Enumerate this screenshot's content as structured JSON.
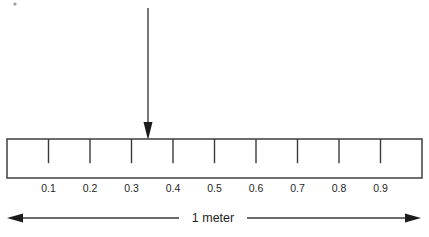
{
  "figure": {
    "background_color": "#ffffff",
    "line_color": "#3b3b3b",
    "outline_color": "#4a4a4a",
    "arrow_fill_color": "#1c1c1c",
    "text_color": "#1f1f1f"
  },
  "ruler": {
    "name": "meter-stick",
    "left_x": 7,
    "right_x": 422,
    "top_y": 139,
    "bottom_y": 178,
    "segments": 10,
    "tick_count": 9,
    "tick_depth_fraction": 0.62,
    "tick_labels": [
      "0.1",
      "0.2",
      "0.3",
      "0.4",
      "0.5",
      "0.6",
      "0.7",
      "0.8",
      "0.9"
    ],
    "tick_values": [
      0.1,
      0.2,
      0.3,
      0.4,
      0.5,
      0.6,
      0.7,
      0.8,
      0.9
    ],
    "label_baseline_y": 192
  },
  "pointer": {
    "name": "measurement-pointer",
    "value": 0.34,
    "x": 148,
    "top_y": 8,
    "tip_y": 140,
    "head_width": 9,
    "head_height": 18
  },
  "dimension": {
    "name": "overall-length-dimension",
    "label": "1 meter",
    "left_x": 7,
    "right_x": 421,
    "line_y": 218,
    "label_x": 213,
    "head_width": 16,
    "head_height": 9
  },
  "chart_data": {
    "type": "diagram",
    "axis_min": 0,
    "axis_max": 1,
    "axis_unit": "meter",
    "tick_labels": [
      "0.1",
      "0.2",
      "0.3",
      "0.4",
      "0.5",
      "0.6",
      "0.7",
      "0.8",
      "0.9"
    ],
    "pointer_reading": 0.34,
    "total_length_label": "1 meter"
  }
}
